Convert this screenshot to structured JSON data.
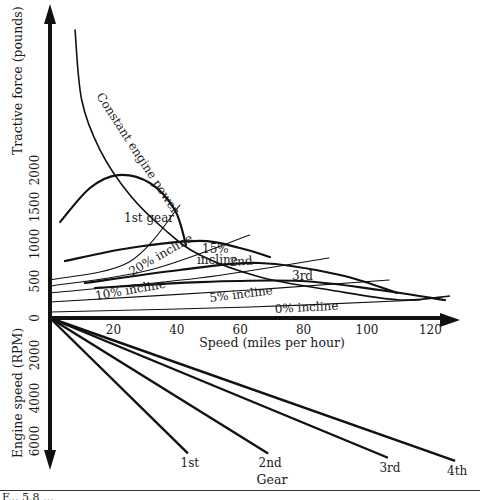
{
  "figure": {
    "caption_visible_fragment": "F... 5.8 ..."
  },
  "chart_data": {
    "type": "line",
    "title": "",
    "xlabel": "Speed (miles per hour)",
    "ylabel": "Tractive force (pounds)",
    "ylabel_lower": "Engine speed (RPM)",
    "xlabel_lower": "Gear",
    "x_ticks": [
      20,
      40,
      60,
      80,
      100,
      120
    ],
    "y_ticks": [
      0,
      500,
      1000,
      1500,
      2000
    ],
    "rpm_ticks": [
      2000,
      4000,
      6000
    ],
    "xlim": [
      0,
      125
    ],
    "ylim": [
      0,
      4000
    ],
    "rpm_lim": [
      0,
      6500
    ],
    "grid": false,
    "series": [
      {
        "name": "Constant engine power",
        "label": "Constant engine power",
        "kind": "power",
        "points": [
          [
            7.9,
            3892
          ],
          [
            10,
            2946
          ],
          [
            15.8,
            2270
          ],
          [
            25.2,
            1662
          ],
          [
            36.3,
            1189
          ],
          [
            47.3,
            851
          ],
          [
            66.2,
            554
          ],
          [
            88.3,
            378
          ],
          [
            110.4,
            243
          ],
          [
            126,
            297
          ]
        ]
      },
      {
        "name": "1st gear",
        "label": "1st gear",
        "kind": "gear",
        "points": [
          [
            3.2,
            1297
          ],
          [
            12.6,
            1757
          ],
          [
            21.5,
            1932
          ],
          [
            31.5,
            1824
          ],
          [
            39.4,
            1459
          ],
          [
            42.9,
            986
          ]
        ]
      },
      {
        "name": "2nd gear",
        "label": "2nd",
        "kind": "gear",
        "points": [
          [
            4.7,
            770
          ],
          [
            25.2,
            946
          ],
          [
            47.3,
            1041
          ],
          [
            59.9,
            946
          ],
          [
            69.4,
            824
          ]
        ]
      },
      {
        "name": "3rd gear",
        "label": "3rd",
        "kind": "gear",
        "points": [
          [
            11,
            473
          ],
          [
            41,
            649
          ],
          [
            66,
            743
          ],
          [
            91.5,
            581
          ],
          [
            109.5,
            338
          ]
        ]
      },
      {
        "name": "4th gear",
        "label": "",
        "kind": "gear",
        "points": [
          [
            14.2,
            405
          ],
          [
            47.3,
            486
          ],
          [
            78.9,
            500
          ],
          [
            104,
            378
          ],
          [
            124.6,
            243
          ]
        ]
      },
      {
        "name": "0% incline",
        "label": "0% incline",
        "kind": "incline",
        "points": [
          [
            0,
            81
          ],
          [
            63,
            149
          ],
          [
            116.7,
            243
          ]
        ]
      },
      {
        "name": "5% incline",
        "label": "5% incline",
        "kind": "incline",
        "points": [
          [
            0,
            216
          ],
          [
            63,
            378
          ],
          [
            107,
            514
          ]
        ]
      },
      {
        "name": "10% incline",
        "label": "10% incline",
        "kind": "incline",
        "points": [
          [
            0,
            338
          ],
          [
            47,
            540
          ],
          [
            88,
            811
          ]
        ]
      },
      {
        "name": "15% incline",
        "label": "15% incline",
        "kind": "incline",
        "points": [
          [
            0,
            432
          ],
          [
            31.5,
            649
          ],
          [
            63,
            1122
          ]
        ]
      },
      {
        "name": "20% incline",
        "label": "20% incline",
        "kind": "incline",
        "points": [
          [
            0,
            514
          ],
          [
            25,
            757
          ],
          [
            41,
            1527
          ]
        ]
      }
    ],
    "gear_rpm_lines": [
      {
        "gear": "1st",
        "end_mph": 43.5,
        "end_rpm": 6300
      },
      {
        "gear": "2nd",
        "end_mph": 68.8,
        "end_rpm": 6300
      },
      {
        "gear": "3rd",
        "end_mph": 106.6,
        "end_rpm": 6500
      },
      {
        "gear": "4th",
        "end_mph": 127.8,
        "end_rpm": 6650
      }
    ]
  }
}
